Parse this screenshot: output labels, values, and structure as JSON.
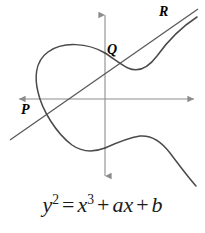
{
  "figure": {
    "background_color": "#ffffff",
    "stroke_color": "#4a4a4a",
    "axis_color": "#8c8c8c",
    "label_color": "#000000",
    "equation_color": "#1a1a1a"
  },
  "axes": {
    "x_axis": {
      "name": "x-axis",
      "y": 99,
      "x_start": 17,
      "x_end": 196,
      "arrow_left": true,
      "arrow_right": true
    },
    "y_axis": {
      "name": "y-axis",
      "x": 105,
      "y_start": 12,
      "y_end": 179,
      "arrow_up": true,
      "arrow_down": true
    }
  },
  "points": [
    {
      "id": "P",
      "label": "P",
      "x": 35,
      "y": 107,
      "label_x": 21,
      "label_y": 103
    },
    {
      "id": "Q",
      "label": "Q",
      "x": 105,
      "y": 61,
      "label_x": 107,
      "label_y": 43
    },
    {
      "id": "R",
      "label": "R",
      "x": 178,
      "y": 23,
      "label_x": 159,
      "label_y": 5
    }
  ],
  "secant_line": {
    "name": "secant-line-through-P-Q-R",
    "x1": 10,
    "y1": 140,
    "x2": 198,
    "y2": 9
  },
  "curve": {
    "name": "elliptic-curve",
    "oval_path": "M 105 53 C 88 43 63 41 48 52 C 34 62 35 80 38 92 C 42 110 56 133 72 145 C 82 152 92 153 105 148",
    "right_upper_path": "M 105 53 C 113 58 120 64 128 68 C 139 73 148 68 157 56 C 167 42 180 28 197 17",
    "right_lower_path": "M 105 148 C 116 143 128 138 140 136 C 152 135 161 141 170 153 C 179 165 188 177 196 186"
  },
  "equation": {
    "name": "curve-equation",
    "text": "y² = x³ + ax + b",
    "lhs_var": "y",
    "lhs_exp": "2",
    "eq_sign": "=",
    "term1_var": "x",
    "term1_exp": "3",
    "plus1": "+",
    "term2_coef": "a",
    "term2_var": "x",
    "plus2": "+",
    "term3": "b"
  }
}
